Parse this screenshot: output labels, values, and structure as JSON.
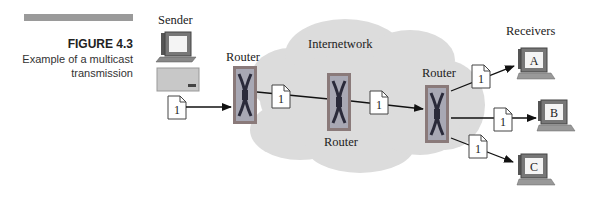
{
  "figure": {
    "number": "FIGURE 4.3",
    "title": "Example of a multicast transmission"
  },
  "labels": {
    "sender": "Sender",
    "receivers": "Receivers",
    "internetwork": "Internetwork",
    "router_left": "Router",
    "router_middle": "Router",
    "router_right": "Router"
  },
  "packets": {
    "p1": "1",
    "p2": "1",
    "p3": "1",
    "p4": "1",
    "p5": "1",
    "p6": "1"
  },
  "receivers": {
    "a": "A",
    "b": "B",
    "c": "C"
  },
  "colors": {
    "cloud": "#dcdcdc",
    "router_outer": "#8a7a7a",
    "router_inner": "#a8a8b4",
    "caption_bar": "#9a9a9a"
  }
}
